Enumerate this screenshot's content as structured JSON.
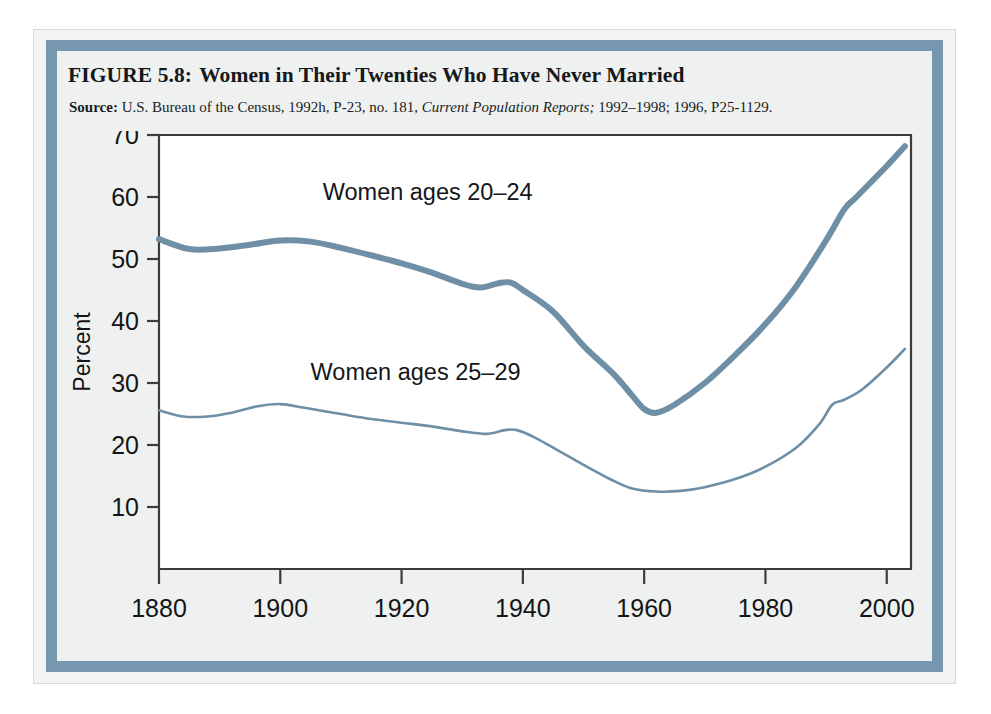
{
  "figure": {
    "number": "FIGURE 5.8:",
    "title": "Women in Their Twenties Who Have Never Married",
    "source_label": "Source:",
    "source_text_a": "U.S. Bureau of the Census, 1992h, P-23, no. 181,",
    "source_text_italic": "Current Population Reports;",
    "source_text_b": "1992–1998; 1996, P25-1129."
  },
  "colors": {
    "frame_blue": "#7697ad",
    "series_20_24": "#6e8fa5",
    "series_25_29": "#6e8fa5",
    "axis": "#3a3c3e",
    "panel_bg": "#eef1f0",
    "plot_bg": "#ffffff",
    "text": "#141517"
  },
  "chart_data": {
    "type": "line",
    "title": "Women in Their Twenties Who Have Never Married",
    "xlabel": "",
    "ylabel": "Percent",
    "xlim": [
      1880,
      2004
    ],
    "ylim": [
      0,
      70
    ],
    "yticks": [
      10,
      20,
      30,
      40,
      50,
      60,
      70
    ],
    "xticks": [
      1880,
      1900,
      1920,
      1940,
      1960,
      1980,
      2000
    ],
    "xtick_labels": [
      "1880",
      "1900",
      "1920",
      "1940",
      "1960",
      "1980",
      "2000"
    ],
    "ytick_labels": [
      "10",
      "20",
      "30",
      "40",
      "50",
      "60",
      "70"
    ],
    "grid": false,
    "legend": "inline-annotations",
    "annotations": [
      {
        "text": "Women ages 20–24",
        "x": 1907,
        "y": 59.5
      },
      {
        "text": "Women ages 25–29",
        "x": 1905,
        "y": 30.5
      }
    ],
    "series": [
      {
        "name": "Women ages 20–24",
        "color": "#6e8fa5",
        "line_width": 6,
        "x": [
          1880,
          1885,
          1890,
          1895,
          1900,
          1905,
          1910,
          1915,
          1920,
          1925,
          1930,
          1933,
          1936,
          1938,
          1940,
          1945,
          1950,
          1955,
          1958,
          1960,
          1962,
          1965,
          1970,
          1975,
          1980,
          1985,
          1990,
          1993,
          1995,
          2000,
          2003
        ],
        "values": [
          53.2,
          51.6,
          51.7,
          52.3,
          53.0,
          52.8,
          51.8,
          50.6,
          49.3,
          47.8,
          46.0,
          45.4,
          46.1,
          46.2,
          45.0,
          41.5,
          36.0,
          31.4,
          28.0,
          25.8,
          25.2,
          26.5,
          30.0,
          34.5,
          39.5,
          45.5,
          53.0,
          58.0,
          60.0,
          65.0,
          68.2
        ]
      },
      {
        "name": "Women ages 25–29",
        "color": "#6e8fa5",
        "line_width": 2.6,
        "x": [
          1880,
          1884,
          1888,
          1892,
          1896,
          1900,
          1904,
          1910,
          1915,
          1920,
          1925,
          1930,
          1934,
          1937,
          1939,
          1942,
          1946,
          1950,
          1955,
          1958,
          1962,
          1966,
          1970,
          1975,
          1980,
          1985,
          1989,
          1991,
          1993,
          1996,
          2000,
          2003
        ],
        "values": [
          25.6,
          24.6,
          24.6,
          25.2,
          26.2,
          26.6,
          26.0,
          25.0,
          24.2,
          23.6,
          23.0,
          22.2,
          21.8,
          22.4,
          22.4,
          21.2,
          19.0,
          16.8,
          14.2,
          13.0,
          12.5,
          12.6,
          13.2,
          14.5,
          16.5,
          19.5,
          23.5,
          26.5,
          27.3,
          29.0,
          32.5,
          35.5
        ]
      }
    ]
  }
}
